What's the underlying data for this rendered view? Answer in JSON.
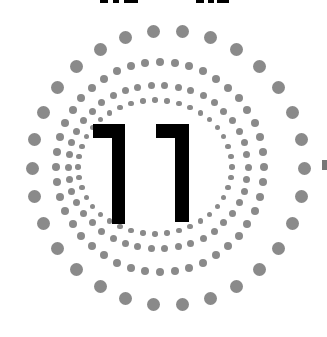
{
  "figure": {
    "number_label": "11",
    "dot_color": "#8a8a8a",
    "digit_color": "#000000",
    "background": "#ffffff"
  },
  "rings": [
    {
      "name": "outer-ring",
      "cx": 168,
      "cy": 168,
      "rx": 136,
      "ry": 137,
      "dot_size": 13,
      "count": 30
    },
    {
      "name": "ring-2",
      "cx": 160,
      "cy": 167,
      "rx": 104,
      "ry": 105,
      "dot_size": 8,
      "count": 44
    },
    {
      "name": "ring-3",
      "cx": 158,
      "cy": 167,
      "rx": 90,
      "ry": 82,
      "dot_size": 7,
      "count": 42
    },
    {
      "name": "ring-4",
      "cx": 155,
      "cy": 167,
      "rx": 77,
      "ry": 67,
      "dot_size": 5.5,
      "count": 40
    }
  ],
  "digits": [
    {
      "bar": {
        "x": 93,
        "y": 124,
        "w": 32,
        "h": 14
      },
      "stem": {
        "x": 112,
        "y": 124,
        "w": 13,
        "h": 100
      }
    },
    {
      "bar": {
        "x": 156,
        "y": 124,
        "w": 32,
        "h": 14
      },
      "stem": {
        "x": 175,
        "y": 124,
        "w": 14,
        "h": 98
      }
    }
  ],
  "top_fragments": [
    {
      "x": 100,
      "w": 8
    },
    {
      "x": 113,
      "w": 6
    },
    {
      "x": 124,
      "w": 14
    },
    {
      "x": 196,
      "w": 8
    },
    {
      "x": 208,
      "w": 6
    },
    {
      "x": 217,
      "w": 12
    }
  ],
  "edge_mark": {
    "x": 322,
    "y": 160,
    "w": 5,
    "h": 10
  }
}
